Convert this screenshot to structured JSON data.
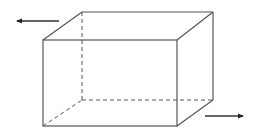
{
  "diagram": {
    "type": "rectangular-prism",
    "stroke_color": "#555555",
    "arrow_color": "#222222",
    "background": "#ffffff",
    "front_face": {
      "tl": [
        43,
        40
      ],
      "tr": [
        177,
        40
      ],
      "br": [
        177,
        126
      ],
      "bl": [
        43,
        126
      ]
    },
    "back_face": {
      "tl": [
        82,
        12
      ],
      "tr": [
        213,
        12
      ],
      "br": [
        213,
        100
      ],
      "bl": [
        82,
        100
      ]
    },
    "hidden_edges": [
      "back-left-vertical",
      "back-bottom",
      "bottom-left-depth"
    ],
    "arrows": [
      {
        "name": "left-arrow",
        "direction": "left",
        "from": [
          59,
          21
        ],
        "to": [
          16,
          21
        ]
      },
      {
        "name": "right-arrow",
        "direction": "right",
        "from": [
          205,
          116
        ],
        "to": [
          244,
          116
        ]
      }
    ]
  }
}
